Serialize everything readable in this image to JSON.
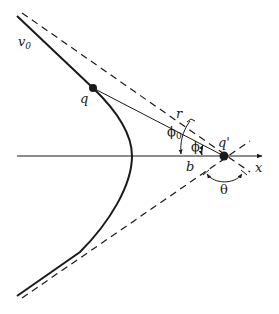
{
  "diagram": {
    "type": "hyperbolic-scattering-trajectory",
    "colors": {
      "stroke": "#1a1a1a",
      "background": "#ffffff"
    },
    "labels": {
      "trajectory": "v",
      "trajectory_sub": "0",
      "projectile": "q",
      "target": "q'",
      "radius": "r",
      "phi0": "ϕ",
      "phi0_sub": "0",
      "phi": "ϕ",
      "impact_parameter": "b",
      "axis": "x",
      "scattering_angle": "θ"
    }
  }
}
